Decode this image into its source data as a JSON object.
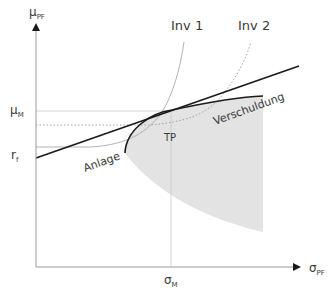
{
  "diagram": {
    "axes": {
      "y_label_main": "μ",
      "y_label_sub": "PF",
      "x_label_main": "σ",
      "x_label_sub": "PF"
    },
    "ticks": {
      "mu_m_main": "μ",
      "mu_m_sub": "M",
      "rf_main": "r",
      "rf_sub": "f",
      "sigma_m_main": "σ",
      "sigma_m_sub": "M"
    },
    "curves": {
      "inv1": "Inv 1",
      "inv2": "Inv 2"
    },
    "annotations": {
      "tangency_point": "TP",
      "lending": "Anlage",
      "borrowing": "Verschuldung"
    },
    "colors": {
      "axis": "#999999",
      "line": "#1a1a1a",
      "shade": "#e3e3e3",
      "guide": "#cccccc",
      "indifference": "#999999"
    }
  }
}
